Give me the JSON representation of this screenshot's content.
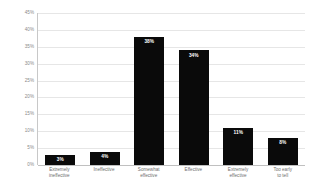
{
  "chart_data": {
    "type": "bar",
    "title": "",
    "xlabel": "",
    "ylabel": "Percent of respondents",
    "categories": [
      "Extremely ineffective",
      "Ineffective",
      "Somewhat effective",
      "Effective",
      "Extremely effective",
      "Too early to tell"
    ],
    "category_lines": [
      [
        "Extremely",
        "ineffective"
      ],
      [
        "Ineffective"
      ],
      [
        "Somewhat",
        "effective"
      ],
      [
        "Effective"
      ],
      [
        "Extremely",
        "effective"
      ],
      [
        "Too early",
        "to tell"
      ]
    ],
    "values": [
      3,
      4,
      38,
      34,
      11,
      8
    ],
    "data_labels": [
      "3%",
      "4%",
      "38%",
      "34%",
      "11%",
      "8%"
    ],
    "ylim": [
      0,
      45
    ],
    "ytick_values": [
      0,
      5,
      10,
      15,
      20,
      25,
      30,
      35,
      40,
      45
    ],
    "ytick_labels": [
      "0%",
      "5%",
      "10%",
      "15%",
      "20%",
      "25%",
      "30%",
      "35%",
      "40%",
      "45%"
    ],
    "grid": true,
    "legend": "none",
    "bar_color": "#0a0a0a",
    "data_label_color": "#ffffff",
    "gridline_color": "#e6e6e6",
    "axis_color": "#c8c8c8",
    "tick_label_color": "#8a8a8a",
    "background_color": "#ffffff"
  }
}
